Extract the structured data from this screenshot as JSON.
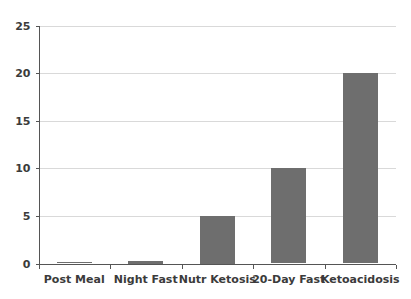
{
  "chart_data": {
    "type": "bar",
    "title": "",
    "subtitle": "",
    "xlabel": "",
    "ylabel": "",
    "categories": [
      "Post Meal",
      "Night Fast",
      "Nutr Ketosis",
      "20-Day Fast",
      "Ketoacidosis"
    ],
    "values": [
      0.1,
      0.3,
      5,
      10,
      20
    ],
    "ylim": [
      0,
      25
    ],
    "ytick_labels": [
      "0",
      "5",
      "10",
      "15",
      "20",
      "25"
    ],
    "ytick_values": [
      0,
      5,
      10,
      15,
      20,
      25
    ],
    "grid": true,
    "grid_axis": "y",
    "legend": false,
    "legend_position": "none",
    "colors": {
      "bar": "#6e6e6e",
      "gridline": "#d9d9d9",
      "axis": "#555555",
      "text": "#3b3b3b",
      "background": "#ffffff"
    }
  }
}
